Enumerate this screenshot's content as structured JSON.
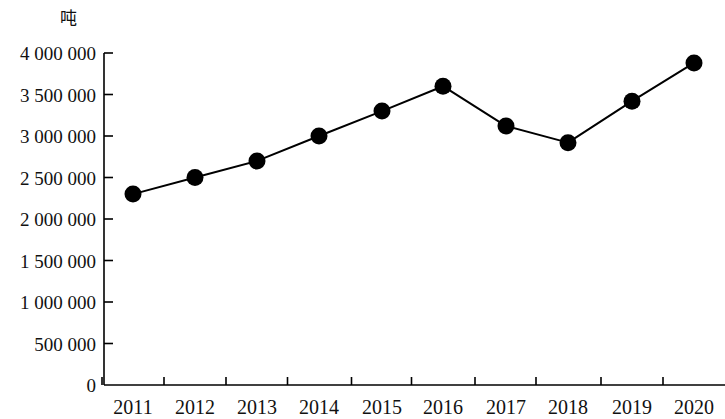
{
  "chart_data": {
    "type": "line",
    "title": "",
    "subtitle": "",
    "xlabel": "",
    "ylabel": "吨",
    "unit_label": "吨",
    "categories": [
      "2011",
      "2012",
      "2013",
      "2014",
      "2015",
      "2016",
      "2017",
      "2018",
      "2019",
      "2020"
    ],
    "values": [
      2300000,
      2500000,
      2700000,
      3000000,
      3300000,
      3600000,
      3120000,
      2920000,
      3420000,
      3880000
    ],
    "series": [
      {
        "name": "产量",
        "values": [
          2300000,
          2500000,
          2700000,
          3000000,
          3300000,
          3600000,
          3120000,
          2920000,
          3420000,
          3880000
        ]
      }
    ],
    "ylim": [
      0,
      4000000
    ],
    "ytick_values": [
      0,
      500000,
      1000000,
      1500000,
      2000000,
      2500000,
      3000000,
      3500000,
      4000000
    ],
    "ytick_labels": [
      "0",
      "500 000",
      "1 000 000",
      "1 500 000",
      "2 000 000",
      "2 500 000",
      "3 000 000",
      "3 500 000",
      "4 000 000"
    ],
    "grid": false,
    "legend": false,
    "legend_position": "none",
    "marker": "circle",
    "marker_color": "#000000",
    "line_color": "#000000",
    "axis_color": "#000000",
    "background": "#ffffff"
  },
  "layout": {
    "plot_left": 104,
    "plot_right": 725,
    "plot_top": 53,
    "plot_bottom": 385,
    "point_x": [
      133,
      195,
      257,
      319,
      382,
      443,
      506,
      568,
      632,
      694
    ],
    "unit_label_x": 60,
    "unit_label_y": 10
  }
}
